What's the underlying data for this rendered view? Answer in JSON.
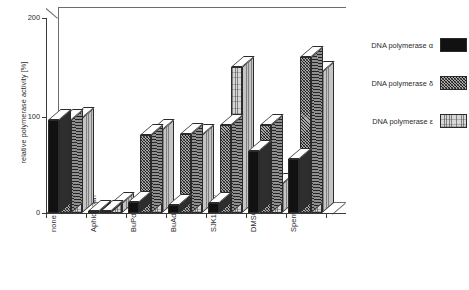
{
  "chart_data": {
    "type": "bar",
    "title": "",
    "xlabel": "",
    "ylabel": "relative polymerase activity [%]",
    "ylim": [
      0,
      200
    ],
    "yticks": [
      0,
      100,
      200
    ],
    "grid": false,
    "legend_position": "right",
    "style": "3d-grouped-bar",
    "categories": [
      "none",
      "Aphidicolin",
      "BuPdGTP",
      "BuAdATP",
      "SJK132-20",
      "DMSO",
      "Spermine"
    ],
    "series": [
      {
        "name": "DNA polymerase α",
        "fill": "solid-black",
        "color": "#111111",
        "values": [
          95,
          2,
          11,
          8,
          10,
          64,
          55
        ]
      },
      {
        "name": "DNA polymerase δ",
        "fill": "cross-hatch",
        "color": "#a9a9a9",
        "values": [
          95,
          2,
          80,
          81,
          90,
          90,
          160
        ]
      },
      {
        "name": "DNA polymerase ε",
        "fill": "stipple",
        "color": "#d7d7d7",
        "values": [
          97,
          10,
          85,
          80,
          150,
          30,
          145
        ]
      }
    ]
  },
  "axis": {
    "y_tick_labels": [
      "200",
      "100",
      "0"
    ],
    "y_title": "relative polymerase activity [%]"
  },
  "legend": {
    "entries": [
      {
        "label": "DNA polymerase α",
        "swatch": "solid-black-swatch"
      },
      {
        "label": "DNA polymerase δ",
        "swatch": "cross-hatch-swatch"
      },
      {
        "label": "DNA polymerase ε",
        "swatch": "stipple-swatch"
      }
    ]
  }
}
